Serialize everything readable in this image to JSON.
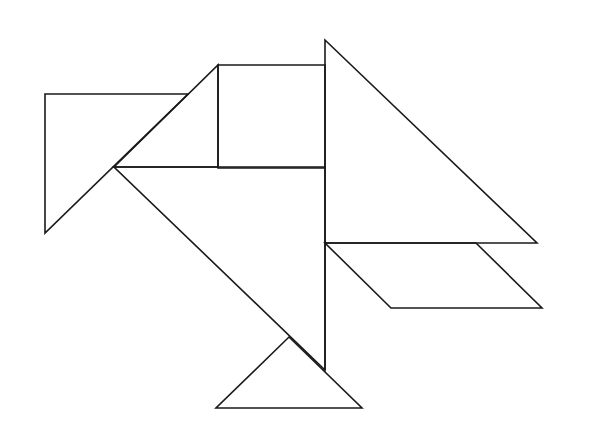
{
  "figure": {
    "type": "tangram",
    "stroke_color": "#1a1a1a",
    "background": "#ffffff",
    "pieces": [
      {
        "name": "left-triangle",
        "points": "45,94 188,94 45,233"
      },
      {
        "name": "beak-small-triangle",
        "points": "114,167 218,65 218,167"
      },
      {
        "name": "square",
        "points": "218,65 325,65 325,168 218,168"
      },
      {
        "name": "large-triangle-right",
        "points": "325,40 537,243 325,243"
      },
      {
        "name": "large-triangle-body",
        "points": "114,167 325,167 325,370"
      },
      {
        "name": "parallelogram",
        "points": "325,243 476,243 542,308 391,308"
      },
      {
        "name": "bottom-triangle",
        "points": "289,337 362,408 216,408"
      }
    ],
    "extra_lines": [
      {
        "name": "body-vertical-edge",
        "x1": 325,
        "y1": 243,
        "x2": 325,
        "y2": 370
      }
    ]
  }
}
